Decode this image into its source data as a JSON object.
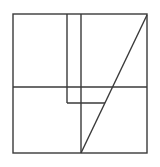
{
  "figure": {
    "background_color": "#ffffff",
    "stroke_color": "#3a3a3a",
    "stroke_width": 1.4,
    "viewbox": {
      "width": 160,
      "height": 167
    },
    "outer_square": {
      "x": 13,
      "y": 14,
      "width": 134,
      "height": 139
    },
    "segments": [
      {
        "name": "horizontal-midline",
        "x1": 13,
        "y1": 87,
        "x2": 147,
        "y2": 87
      },
      {
        "name": "vertical-line-left",
        "x1": 67,
        "y1": 14,
        "x2": 67,
        "y2": 103
      },
      {
        "name": "vertical-line-right",
        "x1": 81,
        "y1": 14,
        "x2": 81,
        "y2": 153
      },
      {
        "name": "short-horizontal-hook",
        "x1": 67,
        "y1": 103,
        "x2": 105,
        "y2": 103
      },
      {
        "name": "diagonal-line",
        "x1": 147,
        "y1": 15,
        "x2": 81,
        "y2": 153
      }
    ]
  }
}
